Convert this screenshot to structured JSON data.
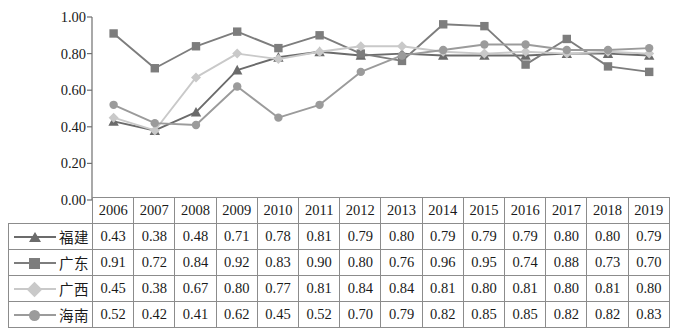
{
  "chart_data": {
    "type": "line",
    "title": "",
    "xlabel": "",
    "ylabel": "",
    "ylim": [
      0.0,
      1.0
    ],
    "ytick_labels": [
      "0.00",
      "0.20",
      "0.40",
      "0.60",
      "0.80",
      "1.00"
    ],
    "ytick_values": [
      0.0,
      0.2,
      0.4,
      0.6,
      0.8,
      1.0
    ],
    "grid": false,
    "legend_position": "table-row-labels",
    "categories": [
      "2006",
      "2007",
      "2008",
      "2009",
      "2010",
      "2011",
      "2012",
      "2013",
      "2014",
      "2015",
      "2016",
      "2017",
      "2018",
      "2019"
    ],
    "series": [
      {
        "name": "福建",
        "marker": "triangle",
        "color": "#6b6b6b",
        "values": [
          0.43,
          0.38,
          0.48,
          0.71,
          0.78,
          0.81,
          0.79,
          0.8,
          0.79,
          0.79,
          0.79,
          0.8,
          0.8,
          0.79
        ]
      },
      {
        "name": "广东",
        "marker": "square",
        "color": "#7d7d7d",
        "values": [
          0.91,
          0.72,
          0.84,
          0.92,
          0.83,
          0.9,
          0.8,
          0.76,
          0.96,
          0.95,
          0.74,
          0.88,
          0.73,
          0.7
        ]
      },
      {
        "name": "广西",
        "marker": "diamond",
        "color": "#c9c9c9",
        "values": [
          0.45,
          0.38,
          0.67,
          0.8,
          0.77,
          0.81,
          0.84,
          0.84,
          0.81,
          0.8,
          0.81,
          0.8,
          0.81,
          0.8
        ]
      },
      {
        "name": "海南",
        "marker": "circle",
        "color": "#9b9b9b",
        "values": [
          0.52,
          0.42,
          0.41,
          0.62,
          0.45,
          0.52,
          0.7,
          0.79,
          0.82,
          0.85,
          0.85,
          0.82,
          0.82,
          0.83
        ]
      }
    ]
  },
  "table": {
    "corner_label": "",
    "year_headers": [
      "2006",
      "2007",
      "2008",
      "2009",
      "2010",
      "2011",
      "2012",
      "2013",
      "2014",
      "2015",
      "2016",
      "2017",
      "2018",
      "2019"
    ],
    "rows": [
      {
        "label": "福建",
        "marker": "triangle",
        "color": "#6b6b6b",
        "values": [
          "0.43",
          "0.38",
          "0.48",
          "0.71",
          "0.78",
          "0.81",
          "0.79",
          "0.80",
          "0.79",
          "0.79",
          "0.79",
          "0.80",
          "0.80",
          "0.79"
        ]
      },
      {
        "label": "广东",
        "marker": "square",
        "color": "#7d7d7d",
        "values": [
          "0.91",
          "0.72",
          "0.84",
          "0.92",
          "0.83",
          "0.90",
          "0.80",
          "0.76",
          "0.96",
          "0.95",
          "0.74",
          "0.88",
          "0.73",
          "0.70"
        ]
      },
      {
        "label": "广西",
        "marker": "diamond",
        "color": "#c9c9c9",
        "values": [
          "0.45",
          "0.38",
          "0.67",
          "0.80",
          "0.77",
          "0.81",
          "0.84",
          "0.84",
          "0.81",
          "0.80",
          "0.81",
          "0.80",
          "0.81",
          "0.80"
        ]
      },
      {
        "label": "海南",
        "marker": "circle",
        "color": "#9b9b9b",
        "values": [
          "0.52",
          "0.42",
          "0.41",
          "0.62",
          "0.45",
          "0.52",
          "0.70",
          "0.79",
          "0.82",
          "0.85",
          "0.85",
          "0.82",
          "0.82",
          "0.83"
        ]
      }
    ]
  },
  "axis": {
    "tick_0": "0.00",
    "tick_1": "0.20",
    "tick_2": "0.40",
    "tick_3": "0.60",
    "tick_4": "0.80",
    "tick_5": "1.00"
  }
}
